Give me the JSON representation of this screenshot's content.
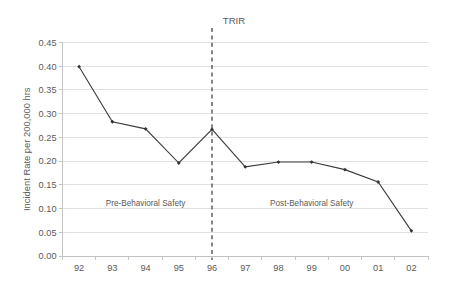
{
  "chart_data": {
    "type": "line",
    "title": "TRIR",
    "xlabel": "",
    "ylabel": "Incident Rate per 200,000 hrs",
    "categories": [
      "92",
      "93",
      "94",
      "95",
      "96",
      "97",
      "98",
      "99",
      "00",
      "01",
      "02"
    ],
    "values": [
      0.399,
      0.283,
      0.268,
      0.196,
      0.267,
      0.188,
      0.198,
      0.198,
      0.182,
      0.156,
      0.053
    ],
    "series": [
      {
        "name": "TRIR",
        "values": [
          0.399,
          0.283,
          0.268,
          0.196,
          0.267,
          0.188,
          0.198,
          0.198,
          0.182,
          0.156,
          0.053
        ]
      }
    ],
    "ylim": [
      0.0,
      0.45
    ],
    "ytick_labels": [
      "0.00",
      "0.05",
      "0.10",
      "0.15",
      "0.20",
      "0.25",
      "0.30",
      "0.35",
      "0.40",
      "0.45"
    ],
    "ytick_values": [
      0.0,
      0.05,
      0.1,
      0.15,
      0.2,
      0.25,
      0.3,
      0.35,
      0.4,
      0.45
    ],
    "grid": true,
    "legend": false,
    "legend_position": "none",
    "line_color": "#3b3b3b",
    "marker_color": "#333333",
    "gridline_color": "#d9d9d9",
    "annotations": [
      {
        "name": "pre-behavioral-safety-label",
        "text": "Pre-Behavioral Safety",
        "x_category": "94",
        "y_value": 0.105
      },
      {
        "name": "post-behavioral-safety-label",
        "text": "Post-Behavioral Safety",
        "x_category": "99",
        "y_value": 0.105
      },
      {
        "name": "intervention-divider",
        "text": "TRIR",
        "x_category": "96",
        "type": "vertical-dashed-line",
        "color": "#555555"
      }
    ]
  }
}
